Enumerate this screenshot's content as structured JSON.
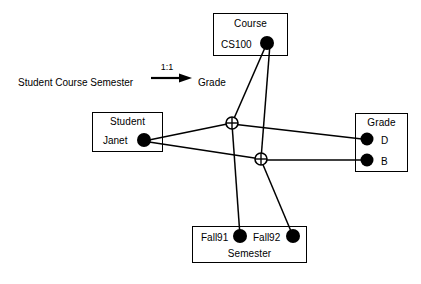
{
  "diagram": {
    "title_row": {
      "lhs_text": "Student Course Semester",
      "cardinality": "1:1",
      "rhs_text": "Grade",
      "arrow_icon": "right-arrow-icon"
    },
    "entities": [
      {
        "id": "course",
        "title": "Course",
        "values": [
          {
            "label": "CS100",
            "dot": "filled-dot"
          }
        ]
      },
      {
        "id": "student",
        "title": "Student",
        "values": [
          {
            "label": "Janet",
            "dot": "filled-dot"
          }
        ]
      },
      {
        "id": "grade",
        "title": "Grade",
        "values": [
          {
            "label": "D",
            "dot": "filled-dot"
          },
          {
            "label": "B",
            "dot": "filled-dot"
          }
        ]
      },
      {
        "id": "semester",
        "title": "Semester",
        "values": [
          {
            "label": "Fall91",
            "dot": "filled-dot"
          },
          {
            "label": "Fall92",
            "dot": "filled-dot"
          }
        ]
      }
    ],
    "relationship_nodes": [
      {
        "id": "rel-node-1",
        "icon": "crossed-circle-icon"
      },
      {
        "id": "rel-node-2",
        "icon": "crossed-circle-icon"
      }
    ],
    "connections": [
      {
        "from": "CS100",
        "to": "rel-node-1"
      },
      {
        "from": "CS100",
        "to": "rel-node-2"
      },
      {
        "from": "Janet",
        "to": "rel-node-1"
      },
      {
        "from": "Janet",
        "to": "rel-node-2"
      },
      {
        "from": "rel-node-1",
        "to": "D"
      },
      {
        "from": "rel-node-2",
        "to": "B"
      },
      {
        "from": "rel-node-1",
        "to": "Fall91"
      },
      {
        "from": "rel-node-2",
        "to": "Fall92"
      }
    ],
    "colors": {
      "stroke": "#000000",
      "background": "#ffffff"
    }
  }
}
